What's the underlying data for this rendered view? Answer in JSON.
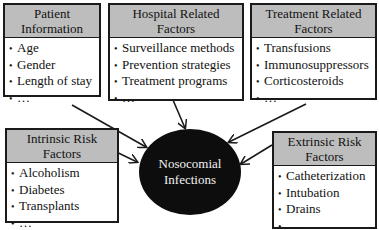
{
  "diagram": {
    "center": {
      "line1": "Nosocomial",
      "line2": "Infections",
      "fill": "#0d0d0d",
      "text_color": "#f2f2f2"
    },
    "header_fill": "#bdbdbd",
    "boxes": [
      {
        "id": "patient-information",
        "title1": "Patient",
        "title2": "Information",
        "items": [
          "Age",
          "Gender",
          "Length of stay",
          "…"
        ]
      },
      {
        "id": "hospital-related-factors",
        "title1": "Hospital Related",
        "title2": "Factors",
        "items": [
          "Surveillance methods",
          "Prevention strategies",
          "Treatment programs",
          "…"
        ]
      },
      {
        "id": "treatment-related-factors",
        "title1": "Treatment Related",
        "title2": "Factors",
        "items": [
          "Transfusions",
          "Immunosuppressors",
          "Corticosteroids",
          "…"
        ]
      },
      {
        "id": "intrinsic-risk-factors",
        "title1": "Intrinsic Risk",
        "title2": "Factors",
        "items": [
          "Alcoholism",
          "Diabetes",
          "Transplants",
          "…"
        ]
      },
      {
        "id": "extrinsic-risk-factors",
        "title1": "Extrinsic Risk",
        "title2": "Factors",
        "items": [
          "Catheterization",
          "Intubation",
          "Drains",
          "…"
        ]
      }
    ],
    "bullet": "•"
  }
}
